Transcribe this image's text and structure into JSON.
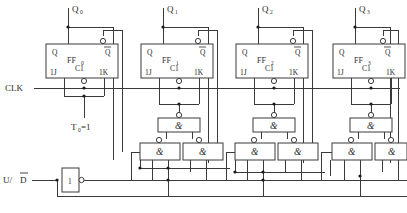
{
  "diagram": {
    "type": "logic-schematic"
  },
  "inputs": {
    "clock": {
      "label": "CLK"
    },
    "updown": {
      "label": "U/",
      "overline": "D"
    },
    "t0": {
      "label": "T",
      "sub": "0",
      "suffix": "=1"
    }
  },
  "outputs": [
    {
      "label": "Q",
      "sub": "0"
    },
    {
      "label": "Q",
      "sub": "1"
    },
    {
      "label": "Q",
      "sub": "2"
    },
    {
      "label": "Q",
      "sub": "3"
    }
  ],
  "flipflops": [
    {
      "name": "FF",
      "sub": "0",
      "q": "Q",
      "qbar": "Q",
      "j": "1J",
      "clk": "C1",
      "k": "1K"
    },
    {
      "name": "FF",
      "sub": "1",
      "q": "Q",
      "qbar": "Q",
      "j": "1J",
      "clk": "C1",
      "k": "1K"
    },
    {
      "name": "FF",
      "sub": "2",
      "q": "Q",
      "qbar": "Q",
      "j": "1J",
      "clk": "C1",
      "k": "1K"
    },
    {
      "name": "FF",
      "sub": "3",
      "q": "Q",
      "qbar": "Q",
      "j": "1J",
      "clk": "C1",
      "k": "1K"
    }
  ],
  "gates": {
    "nand_symbol": "&",
    "inverter_symbol": "1",
    "clusters": [
      {
        "stage": 1,
        "top": "&",
        "left": "&",
        "right": "&"
      },
      {
        "stage": 2,
        "top": "&",
        "left": "&",
        "right": "&"
      },
      {
        "stage": 3,
        "top": "&",
        "left": "&",
        "right": "&"
      }
    ]
  },
  "colors": {
    "wire": "#3a3a3a",
    "text": "#2b2b2b",
    "background": "#ffffff",
    "junction": "#1a1a1a"
  }
}
